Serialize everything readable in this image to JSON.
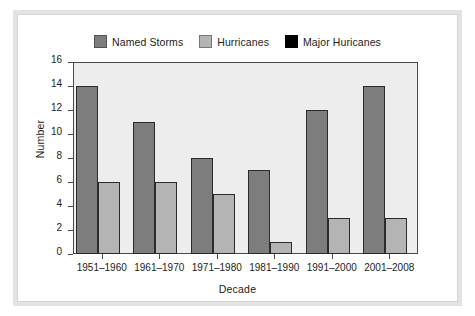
{
  "chart_data": {
    "type": "bar",
    "title": "",
    "xlabel": "Decade",
    "ylabel": "Number",
    "categories": [
      "1951–1960",
      "1961–1970",
      "1971–1980",
      "1981–1990",
      "1991–2000",
      "2001–2008"
    ],
    "series": [
      {
        "name": "Named Storms",
        "color": "#7d7d7d",
        "values": [
          14,
          11,
          8,
          7,
          12,
          14
        ]
      },
      {
        "name": "Hurricanes",
        "color": "#b4b4b4",
        "values": [
          6,
          6,
          5,
          1,
          3,
          3
        ]
      },
      {
        "name": "Major Huricanes",
        "color": "#000000",
        "values": [
          0,
          0,
          0,
          0,
          0,
          0
        ]
      }
    ],
    "ylim": [
      0,
      16
    ],
    "yticks": [
      0,
      2,
      4,
      6,
      8,
      10,
      12,
      14,
      16
    ],
    "ytick_labels": [
      "0",
      "2",
      "4",
      "6",
      "8",
      "10",
      "12",
      "14",
      "16"
    ],
    "grid": false,
    "legend_position": "top-center",
    "plot_background": "#ededed",
    "axis_color": "#4a4a4a",
    "bar_outline_color": "#2b2b2b"
  }
}
